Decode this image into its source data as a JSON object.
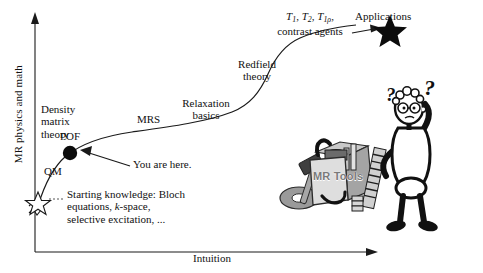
{
  "figure": {
    "kind": "learning-curve-schematic",
    "background": "#ffffff",
    "line_color": "#1a1a1a"
  },
  "axes": {
    "y_label": "MR physics and math",
    "x_label": "Intuition",
    "y_arrow": "up-arrow-icon",
    "x_arrow": "right-arrow-icon",
    "break_mark": "axis-break-squiggle-icon"
  },
  "curve_labels": {
    "qm": "QM",
    "density_matrix": "Density\nmatrix\ntheory",
    "density_matrix_l1": "Density",
    "density_matrix_l2": "matrix",
    "density_matrix_l3": "theory",
    "pof": "POF",
    "mrs": "MRS",
    "relaxation_l1": "Relaxation",
    "relaxation_l2": "basics",
    "redfield_l1": "Redfield",
    "redfield_l2": "theory",
    "contrast_l2": "contrast agents",
    "applications": "Applications"
  },
  "relaxation_times": {
    "t1": "T",
    "t1_sub": "1",
    "t2": "T",
    "t2_sub": "2",
    "t1rho": "T",
    "t1rho_sub": "1ρ",
    "comma": ", ",
    "trailing": ","
  },
  "callouts": {
    "you_are_here": "You are here.",
    "starting_l1": "Starting knowledge: Bloch",
    "starting_l2_a": "equations, ",
    "starting_l2_k": "k",
    "starting_l2_b": "-space,",
    "starting_l3": "selective excitation, ..."
  },
  "markers": {
    "start_star": "star-outline-icon",
    "pof_dot": "filled-circle-icon",
    "end_star": "filled-star-icon",
    "pointer_arrow": "arrow-icon"
  },
  "illustration": {
    "toolbox_label": "MR Tools",
    "toolbox_icon": "toolbox-icon",
    "person_icon": "puzzled-stick-figure-icon",
    "question_mark_1": "?",
    "question_mark_2": "?",
    "colors": {
      "box_face": "#d8d8d8",
      "box_side": "#a8a8a8",
      "box_top": "#bfbfbf",
      "tool_dark": "#4a4a4a",
      "tool_mid": "#8c8c8c",
      "label_text": "#707070"
    }
  }
}
